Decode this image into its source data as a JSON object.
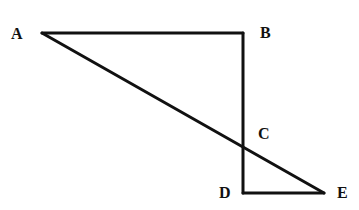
{
  "diagram": {
    "type": "geometry",
    "points": {
      "A": {
        "label": "A",
        "x": 42,
        "y": 33
      },
      "B": {
        "label": "B",
        "x": 243,
        "y": 33
      },
      "C": {
        "label": "C",
        "x": 243,
        "y": 146
      },
      "D": {
        "label": "D",
        "x": 243,
        "y": 193
      },
      "E": {
        "label": "E",
        "x": 324,
        "y": 193
      }
    },
    "segments": [
      "AB",
      "BD",
      "DE",
      "AE"
    ],
    "labels": {
      "A": "A",
      "B": "B",
      "C": "C",
      "D": "D",
      "E": "E"
    },
    "colors": {
      "stroke": "#111111",
      "background": "#ffffff"
    }
  }
}
